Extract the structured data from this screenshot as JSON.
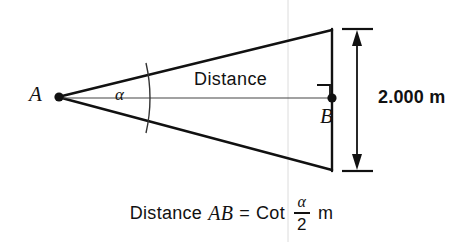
{
  "figure": {
    "background_color": "#ffffff",
    "line_color": "#111111",
    "vertex_a_label": "A",
    "vertex_b_label": "B",
    "angle_label": "α",
    "distance_label": "Distance",
    "dimension_label": "2.000 m",
    "right_angle_marker": "right-angle"
  },
  "caption": {
    "word_distance": "Distance",
    "segment": "AB",
    "equals": "=",
    "function": "Cot",
    "fraction_numerator": "α",
    "fraction_denominator": "2",
    "unit": "m"
  },
  "geometry": {
    "apex_x": 58,
    "apex_y": 97,
    "base_x": 332,
    "base_top_y": 30,
    "base_bottom_y": 170,
    "axis_y": 98,
    "arc_x": 147,
    "dimension_line_x": 357,
    "dimension_tick_left": 342,
    "dimension_tick_right": 373,
    "guide_line_x": 288
  }
}
